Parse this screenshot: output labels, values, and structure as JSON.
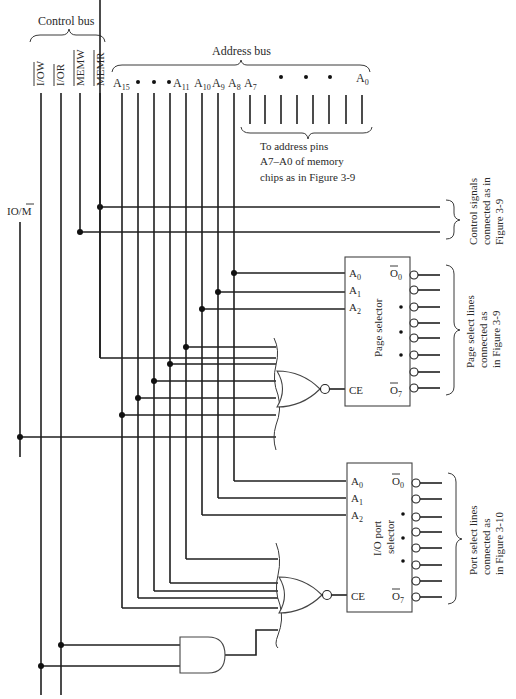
{
  "control_bus": {
    "title": "Control bus",
    "signals": [
      "I/OW",
      "I/OR",
      "MEMW",
      "MEMR"
    ]
  },
  "address_bus": {
    "title": "Address bus",
    "high_labels": [
      {
        "base": "A",
        "sub": "15"
      },
      {
        "base": "•",
        "sub": ""
      },
      {
        "base": "•",
        "sub": ""
      },
      {
        "base": "•A",
        "sub": "11"
      },
      {
        "base": "A",
        "sub": "10"
      },
      {
        "base": "A",
        "sub": "9"
      },
      {
        "base": "A",
        "sub": "8"
      }
    ],
    "low_label_first": {
      "base": "A",
      "sub": "7"
    },
    "low_label_last": {
      "base": "A",
      "sub": "0"
    },
    "low_note": [
      "To address pins",
      "A7–A0 of memory",
      "chips as in Figure 3-9"
    ]
  },
  "io_m_signal": {
    "label": "IO/",
    "bar_part": "M"
  },
  "control_note": [
    "Control signals",
    "connected as in",
    "Figure 3-9"
  ],
  "page_selector": {
    "title": "Page selector",
    "inputs": [
      {
        "base": "A",
        "sub": "0"
      },
      {
        "base": "A",
        "sub": "1"
      },
      {
        "base": "A",
        "sub": "2"
      }
    ],
    "enable": "CE",
    "out_first": {
      "base": "O",
      "sub": "0"
    },
    "out_last": {
      "base": "O",
      "sub": "7"
    },
    "note": [
      "Page select lines",
      "connected as",
      "in Figure 3-9"
    ]
  },
  "io_port_selector": {
    "title_lines": [
      "I/O port",
      "selector"
    ],
    "inputs": [
      {
        "base": "A",
        "sub": "0"
      },
      {
        "base": "A",
        "sub": "1"
      },
      {
        "base": "A",
        "sub": "2"
      }
    ],
    "enable": "CE",
    "out_first": {
      "base": "O",
      "sub": "0"
    },
    "out_last": {
      "base": "O",
      "sub": "7"
    },
    "note": [
      "Port select lines",
      "connected as",
      "in Figure 3-10"
    ]
  },
  "gates": {
    "page_nor": "NOR gate",
    "port_nor": "NOR gate",
    "and": "AND gate"
  }
}
